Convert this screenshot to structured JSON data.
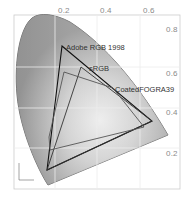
{
  "diagram": {
    "colors": {
      "locus_fill": "#a8a8a8",
      "locus_stroke": "#555555",
      "grid": "#d8d8d8",
      "border": "#cccccc",
      "adobe_rgb": "#111111",
      "srgb": "#333333",
      "coated_fogra39": "#555555"
    },
    "x_ticks": [
      "0.2",
      "0.4",
      "0.6"
    ],
    "y_ticks": [
      "0.8",
      "0.6",
      "0.4",
      "0.2"
    ],
    "gamuts": [
      {
        "name": "Adobe RGB 1998",
        "label": "Adobe RGB 1998"
      },
      {
        "name": "sRGB",
        "label": "sRGB"
      },
      {
        "name": "CoatedFOGRA39",
        "label": "CoatedFOGRA39"
      }
    ],
    "axis_mini": {
      "x_label": "x",
      "y_label": "y"
    }
  }
}
